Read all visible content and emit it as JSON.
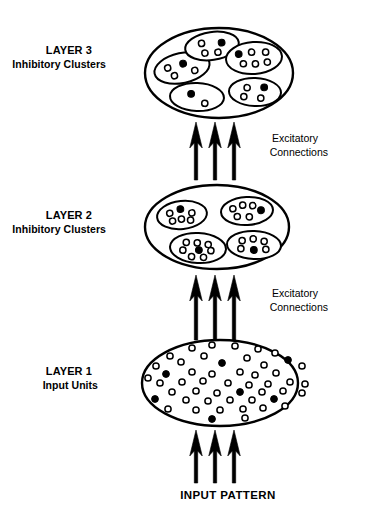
{
  "figure": {
    "background_color": "#ffffff",
    "stroke_color": "#000000",
    "fill_color": "#ffffff"
  },
  "labels": {
    "layer3_title": "LAYER 3",
    "layer3_subtitle": "Inhibitory Clusters",
    "layer2_title": "LAYER 2",
    "layer2_subtitle": "Inhibitory Clusters",
    "layer1_title": "LAYER 1",
    "layer1_subtitle": "Input Units",
    "excitatory_top_line1": "Excitatory",
    "excitatory_top_line2": "Connections",
    "excitatory_bottom_line1": "Excitatory",
    "excitatory_bottom_line2": "Connections",
    "input_pattern": "INPUT PATTERN"
  },
  "legend": {
    "open_circle_meaning": "excitatory unit",
    "filled_circle_meaning": "inhibitory unit"
  },
  "chart_data": {
    "type": "diagram",
    "layers": [
      {
        "id": "layer3",
        "name": "LAYER 3",
        "subtitle": "Inhibitory Clusters",
        "ellipse": {
          "cx": 219,
          "cy": 73,
          "rx": 74,
          "ry": 45
        },
        "clusters": [
          {
            "id": "l3-c1",
            "ellipse": {
              "cx": 182,
              "cy": 68,
              "rx": 28,
              "ry": 15,
              "rot": -12
            },
            "units": [
              {
                "x": -14,
                "y": -3,
                "filled": false
              },
              {
                "x": 2,
                "y": -4,
                "filled": true
              },
              {
                "x": -9,
                "y": 6,
                "filled": false
              },
              {
                "x": 12,
                "y": 5,
                "filled": false
              }
            ]
          },
          {
            "id": "l3-c2",
            "ellipse": {
              "cx": 212,
              "cy": 46,
              "rx": 27,
              "ry": 14,
              "rot": -8
            },
            "units": [
              {
                "x": -10,
                "y": -4,
                "filled": false
              },
              {
                "x": 10,
                "y": -2,
                "filled": true
              },
              {
                "x": -8,
                "y": 6,
                "filled": false
              },
              {
                "x": 5,
                "y": 7,
                "filled": false
              }
            ]
          },
          {
            "id": "l3-c3",
            "ellipse": {
              "cx": 254,
              "cy": 58,
              "rx": 28,
              "ry": 16,
              "rot": -4
            },
            "units": [
              {
                "x": -15,
                "y": -5,
                "filled": true
              },
              {
                "x": -2,
                "y": -6,
                "filled": false
              },
              {
                "x": 12,
                "y": -5,
                "filled": false
              },
              {
                "x": -11,
                "y": 5,
                "filled": false
              },
              {
                "x": 1,
                "y": 6,
                "filled": false
              },
              {
                "x": 13,
                "y": 5,
                "filled": false
              }
            ]
          },
          {
            "id": "l3-c4",
            "ellipse": {
              "cx": 255,
              "cy": 92,
              "rx": 26,
              "ry": 14,
              "rot": 2
            },
            "units": [
              {
                "x": -8,
                "y": -4,
                "filled": false
              },
              {
                "x": 9,
                "y": -5,
                "filled": true
              },
              {
                "x": -11,
                "y": 5,
                "filled": false
              },
              {
                "x": 6,
                "y": 6,
                "filled": false
              }
            ]
          },
          {
            "id": "l3-c5",
            "ellipse": {
              "cx": 197,
              "cy": 97,
              "rx": 27,
              "ry": 14,
              "rot": 2
            },
            "units": [
              {
                "x": -6,
                "y": -3,
                "filled": true
              },
              {
                "x": 8,
                "y": 6,
                "filled": false
              }
            ]
          }
        ]
      },
      {
        "id": "layer2",
        "name": "LAYER 2",
        "subtitle": "Inhibitory Clusters",
        "ellipse": {
          "cx": 217,
          "cy": 227,
          "rx": 72,
          "ry": 42
        },
        "clusters": [
          {
            "id": "l2-c1",
            "ellipse": {
              "cx": 182,
              "cy": 215,
              "rx": 25,
              "ry": 14,
              "rot": -6
            },
            "units": [
              {
                "x": -12,
                "y": -3,
                "filled": false
              },
              {
                "x": -1,
                "y": -6,
                "filled": true
              },
              {
                "x": 10,
                "y": -1,
                "filled": false
              },
              {
                "x": -10,
                "y": 5,
                "filled": false
              },
              {
                "x": -1,
                "y": 4,
                "filled": false
              },
              {
                "x": 8,
                "y": 6,
                "filled": false
              }
            ]
          },
          {
            "id": "l2-c2",
            "ellipse": {
              "cx": 247,
              "cy": 211,
              "rx": 26,
              "ry": 14,
              "rot": -3
            },
            "units": [
              {
                "x": -14,
                "y": -3,
                "filled": false
              },
              {
                "x": -4,
                "y": -6,
                "filled": false
              },
              {
                "x": 6,
                "y": -5,
                "filled": false
              },
              {
                "x": 14,
                "y": 0,
                "filled": true
              },
              {
                "x": -10,
                "y": 5,
                "filled": false
              },
              {
                "x": 2,
                "y": 6,
                "filled": false
              }
            ]
          },
          {
            "id": "l2-c3",
            "ellipse": {
              "cx": 254,
              "cy": 245,
              "rx": 27,
              "ry": 14,
              "rot": 2
            },
            "units": [
              {
                "x": -12,
                "y": -4,
                "filled": false
              },
              {
                "x": -1,
                "y": -6,
                "filled": false
              },
              {
                "x": 10,
                "y": -4,
                "filled": false
              },
              {
                "x": -13,
                "y": 4,
                "filled": false
              },
              {
                "x": 0,
                "y": 5,
                "filled": true
              },
              {
                "x": 12,
                "y": 4,
                "filled": false
              }
            ]
          },
          {
            "id": "l2-c4",
            "ellipse": {
              "cx": 198,
              "cy": 248,
              "rx": 28,
              "ry": 15,
              "rot": 3
            },
            "units": [
              {
                "x": -12,
                "y": -5,
                "filled": false
              },
              {
                "x": -1,
                "y": -5,
                "filled": false
              },
              {
                "x": 10,
                "y": -4,
                "filled": false
              },
              {
                "x": -15,
                "y": 3,
                "filled": false
              },
              {
                "x": 1,
                "y": 2,
                "filled": true
              },
              {
                "x": 13,
                "y": 2,
                "filled": false
              },
              {
                "x": -6,
                "y": 9,
                "filled": false
              },
              {
                "x": 6,
                "y": 9,
                "filled": false
              }
            ]
          }
        ]
      },
      {
        "id": "layer1",
        "name": "LAYER 1",
        "subtitle": "Input Units",
        "ellipse": {
          "cx": 220,
          "cy": 383,
          "rx": 78,
          "ry": 43
        },
        "clusters": [],
        "units": [
          {
            "x": 192,
            "y": 348,
            "filled": false
          },
          {
            "x": 212,
            "y": 345,
            "filled": false
          },
          {
            "x": 235,
            "y": 346,
            "filled": false
          },
          {
            "x": 258,
            "y": 349,
            "filled": false
          },
          {
            "x": 170,
            "y": 356,
            "filled": false
          },
          {
            "x": 204,
            "y": 356,
            "filled": false
          },
          {
            "x": 247,
            "y": 358,
            "filled": false
          },
          {
            "x": 275,
            "y": 353,
            "filled": false
          },
          {
            "x": 156,
            "y": 366,
            "filled": false
          },
          {
            "x": 181,
            "y": 362,
            "filled": false
          },
          {
            "x": 222,
            "y": 363,
            "filled": true
          },
          {
            "x": 264,
            "y": 365,
            "filled": false
          },
          {
            "x": 288,
            "y": 360,
            "filled": true
          },
          {
            "x": 302,
            "y": 366,
            "filled": false
          },
          {
            "x": 166,
            "y": 374,
            "filled": true
          },
          {
            "x": 192,
            "y": 372,
            "filled": false
          },
          {
            "x": 212,
            "y": 374,
            "filled": false
          },
          {
            "x": 240,
            "y": 372,
            "filled": false
          },
          {
            "x": 255,
            "y": 375,
            "filled": false
          },
          {
            "x": 276,
            "y": 373,
            "filled": false
          },
          {
            "x": 148,
            "y": 378,
            "filled": false
          },
          {
            "x": 160,
            "y": 383,
            "filled": false
          },
          {
            "x": 182,
            "y": 382,
            "filled": false
          },
          {
            "x": 203,
            "y": 381,
            "filled": false
          },
          {
            "x": 228,
            "y": 383,
            "filled": false
          },
          {
            "x": 249,
            "y": 385,
            "filled": false
          },
          {
            "x": 268,
            "y": 384,
            "filled": false
          },
          {
            "x": 290,
            "y": 382,
            "filled": false
          },
          {
            "x": 305,
            "y": 384,
            "filled": false
          },
          {
            "x": 172,
            "y": 392,
            "filled": false
          },
          {
            "x": 196,
            "y": 391,
            "filled": false
          },
          {
            "x": 217,
            "y": 393,
            "filled": false
          },
          {
            "x": 240,
            "y": 392,
            "filled": true
          },
          {
            "x": 262,
            "y": 392,
            "filled": false
          },
          {
            "x": 283,
            "y": 391,
            "filled": false
          },
          {
            "x": 302,
            "y": 393,
            "filled": false
          },
          {
            "x": 155,
            "y": 399,
            "filled": true
          },
          {
            "x": 186,
            "y": 400,
            "filled": false
          },
          {
            "x": 208,
            "y": 401,
            "filled": false
          },
          {
            "x": 230,
            "y": 400,
            "filled": false
          },
          {
            "x": 252,
            "y": 400,
            "filled": false
          },
          {
            "x": 274,
            "y": 399,
            "filled": true
          },
          {
            "x": 168,
            "y": 409,
            "filled": false
          },
          {
            "x": 196,
            "y": 410,
            "filled": false
          },
          {
            "x": 220,
            "y": 410,
            "filled": false
          },
          {
            "x": 243,
            "y": 409,
            "filled": false
          },
          {
            "x": 263,
            "y": 408,
            "filled": false
          },
          {
            "x": 285,
            "y": 406,
            "filled": false
          },
          {
            "x": 212,
            "y": 419,
            "filled": true
          },
          {
            "x": 245,
            "y": 418,
            "filled": false
          }
        ]
      }
    ],
    "arrow_groups": [
      {
        "id": "arrows-l2-to-l3",
        "label": "Excitatory Connections",
        "direction": "up",
        "count": 3,
        "x_positions": [
          196,
          215,
          234
        ],
        "y_tip": 122,
        "y_tail": 180
      },
      {
        "id": "arrows-l1-to-l2",
        "label": "Excitatory Connections",
        "direction": "up",
        "count": 3,
        "x_positions": [
          196,
          215,
          234
        ],
        "y_tip": 275,
        "y_tail": 340
      },
      {
        "id": "arrows-input-to-l1",
        "label": "INPUT PATTERN",
        "direction": "up",
        "count": 3,
        "x_positions": [
          196,
          215,
          234
        ],
        "y_tip": 430,
        "y_tail": 483
      }
    ],
    "label_positions": {
      "layer3": {
        "x": 92,
        "y": 54
      },
      "layer2": {
        "x": 92,
        "y": 219
      },
      "layer1": {
        "x": 92,
        "y": 375
      },
      "excitatory_top": {
        "x": 318,
        "y": 142
      },
      "excitatory_bottom": {
        "x": 318,
        "y": 297
      },
      "input_pattern": {
        "x": 228,
        "y": 499
      }
    }
  }
}
